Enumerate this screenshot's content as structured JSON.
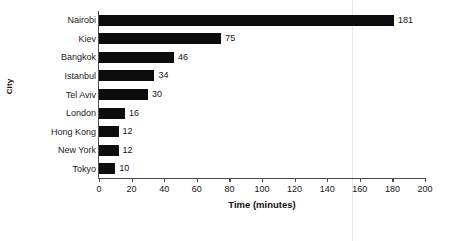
{
  "chart_data": {
    "type": "bar",
    "orientation": "horizontal",
    "title": "",
    "xlabel": "Time (minutes)",
    "ylabel": "City",
    "categories": [
      "Nairobi",
      "Kiev",
      "Bangkok",
      "Istanbul",
      "Tel Aviv",
      "London",
      "Hong Kong",
      "New York",
      "Tokyo"
    ],
    "values": [
      181,
      75,
      46,
      34,
      30,
      16,
      12,
      12,
      10
    ],
    "value_labels": [
      "181",
      "75",
      "46",
      "34",
      "30",
      "16",
      "12",
      "12",
      "10"
    ],
    "xlim": [
      0,
      200
    ],
    "xticks": [
      0,
      20,
      40,
      60,
      80,
      100,
      120,
      140,
      160,
      180,
      200
    ],
    "xtick_labels": [
      "0",
      "20",
      "40",
      "60",
      "80",
      "100",
      "120",
      "140",
      "160",
      "180",
      "200"
    ],
    "grid": false,
    "legend": "none",
    "bar_color": "#0d0d0d",
    "axis_color": "#4a4a4a",
    "background_color": "#ffffff"
  }
}
